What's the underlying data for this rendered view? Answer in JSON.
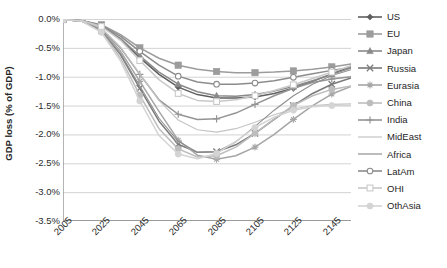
{
  "chart_data": {
    "type": "line",
    "title": "",
    "xlabel": "",
    "ylabel": "GDP loss (% of GDP)",
    "xlim": [
      2005,
      2155
    ],
    "ylim": [
      -3.5,
      0.0
    ],
    "ytick_labels": [
      "0.0%",
      "-0.5%",
      "-1.0%",
      "-1.5%",
      "-2.0%",
      "-2.5%",
      "-3.0%",
      "-3.5%"
    ],
    "ytick_values": [
      0.0,
      -0.5,
      -1.0,
      -1.5,
      -2.0,
      -2.5,
      -3.0,
      -3.5
    ],
    "xtick_labels": [
      "2005",
      "2025",
      "2045",
      "2065",
      "2085",
      "2105",
      "2125",
      "2145"
    ],
    "xtick_values": [
      2005,
      2025,
      2045,
      2065,
      2085,
      2105,
      2125,
      2145
    ],
    "x": [
      2005,
      2015,
      2025,
      2035,
      2045,
      2055,
      2065,
      2075,
      2085,
      2095,
      2105,
      2115,
      2125,
      2135,
      2145,
      2155
    ],
    "grid": "horizontal",
    "legend_position": "right",
    "series": [
      {
        "name": "US",
        "marker": "diamond",
        "color": "#5f5f5f",
        "values": [
          -0.01,
          -0.03,
          -0.12,
          -0.35,
          -0.67,
          -0.96,
          -1.18,
          -1.31,
          -1.37,
          -1.37,
          -1.35,
          -1.29,
          -1.2,
          -1.08,
          -0.95,
          -0.82
        ]
      },
      {
        "name": "EU",
        "marker": "square",
        "color": "#9c9c9c",
        "values": [
          -0.01,
          -0.03,
          -0.1,
          -0.27,
          -0.5,
          -0.68,
          -0.8,
          -0.87,
          -0.91,
          -0.93,
          -0.93,
          -0.92,
          -0.9,
          -0.87,
          -0.83,
          -0.78
        ]
      },
      {
        "name": "Japan",
        "marker": "triangle",
        "color": "#8a8a8a",
        "values": [
          -0.01,
          -0.03,
          -0.12,
          -0.34,
          -0.64,
          -0.92,
          -1.13,
          -1.26,
          -1.33,
          -1.34,
          -1.31,
          -1.25,
          -1.17,
          -1.07,
          -0.96,
          -0.85
        ]
      },
      {
        "name": "Russia",
        "marker": "x",
        "color": "#7a7a7a",
        "values": [
          -0.01,
          -0.04,
          -0.2,
          -0.62,
          -1.2,
          -1.77,
          -2.17,
          -2.31,
          -2.3,
          -2.18,
          -1.98,
          -1.74,
          -1.5,
          -1.29,
          -1.13,
          -1.02
        ]
      },
      {
        "name": "Eurasia",
        "marker": "star",
        "color": "#a6a6a6",
        "values": [
          -0.01,
          -0.04,
          -0.18,
          -0.56,
          -1.08,
          -1.6,
          -2.1,
          -2.36,
          -2.43,
          -2.37,
          -2.22,
          -2.0,
          -1.74,
          -1.5,
          -1.3,
          -1.17
        ]
      },
      {
        "name": "China",
        "marker": "circle-filled",
        "color": "#bdbdbd",
        "values": [
          -0.01,
          -0.04,
          -0.22,
          -0.68,
          -1.32,
          -1.9,
          -2.25,
          -2.39,
          -2.37,
          -2.22,
          -1.98,
          -1.73,
          -1.5,
          -1.33,
          -1.22,
          -1.16
        ]
      },
      {
        "name": "India",
        "marker": "plus",
        "color": "#949494",
        "values": [
          -0.01,
          -0.04,
          -0.17,
          -0.5,
          -0.96,
          -1.4,
          -1.65,
          -1.74,
          -1.73,
          -1.63,
          -1.48,
          -1.33,
          -1.2,
          -1.1,
          -1.04,
          -1.0
        ]
      },
      {
        "name": "MidEast",
        "marker": "none",
        "color": "#c4c4c4",
        "values": [
          -0.01,
          -0.03,
          -0.16,
          -0.49,
          -0.95,
          -1.41,
          -1.75,
          -1.92,
          -1.96,
          -1.9,
          -1.79,
          -1.66,
          -1.56,
          -1.5,
          -1.48,
          -1.47
        ]
      },
      {
        "name": "Africa",
        "marker": "none",
        "color": "#8f8f8f",
        "values": [
          -0.01,
          -0.04,
          -0.2,
          -0.6,
          -1.16,
          -1.72,
          -2.12,
          -2.31,
          -2.3,
          -2.13,
          -1.86,
          -1.58,
          -1.33,
          -1.13,
          -0.98,
          -0.88
        ]
      },
      {
        "name": "LatAm",
        "marker": "circle-open",
        "color": "#8c8c8c",
        "values": [
          -0.01,
          -0.03,
          -0.11,
          -0.3,
          -0.56,
          -0.8,
          -0.99,
          -1.09,
          -1.13,
          -1.13,
          -1.11,
          -1.07,
          -1.01,
          -0.95,
          -0.89,
          -0.84
        ]
      },
      {
        "name": "OHI",
        "marker": "square-open",
        "color": "#c9c9c9",
        "values": [
          -0.01,
          -0.03,
          -0.13,
          -0.37,
          -0.72,
          -1.05,
          -1.29,
          -1.41,
          -1.43,
          -1.4,
          -1.33,
          -1.24,
          -1.14,
          -1.03,
          -0.92,
          -0.81
        ]
      },
      {
        "name": "OthAsia",
        "marker": "circle-light",
        "color": "#d4d4d4",
        "values": [
          -0.01,
          -0.04,
          -0.23,
          -0.73,
          -1.42,
          -2.02,
          -2.34,
          -2.42,
          -2.33,
          -2.12,
          -1.88,
          -1.7,
          -1.58,
          -1.52,
          -1.5,
          -1.5
        ]
      }
    ]
  },
  "legend": {
    "items": [
      {
        "label": "US"
      },
      {
        "label": "EU"
      },
      {
        "label": "Japan"
      },
      {
        "label": "Russia"
      },
      {
        "label": "Eurasia"
      },
      {
        "label": "China"
      },
      {
        "label": "India"
      },
      {
        "label": "MidEast"
      },
      {
        "label": "Africa"
      },
      {
        "label": "LatAm"
      },
      {
        "label": "OHI"
      },
      {
        "label": "OthAsia"
      }
    ]
  }
}
